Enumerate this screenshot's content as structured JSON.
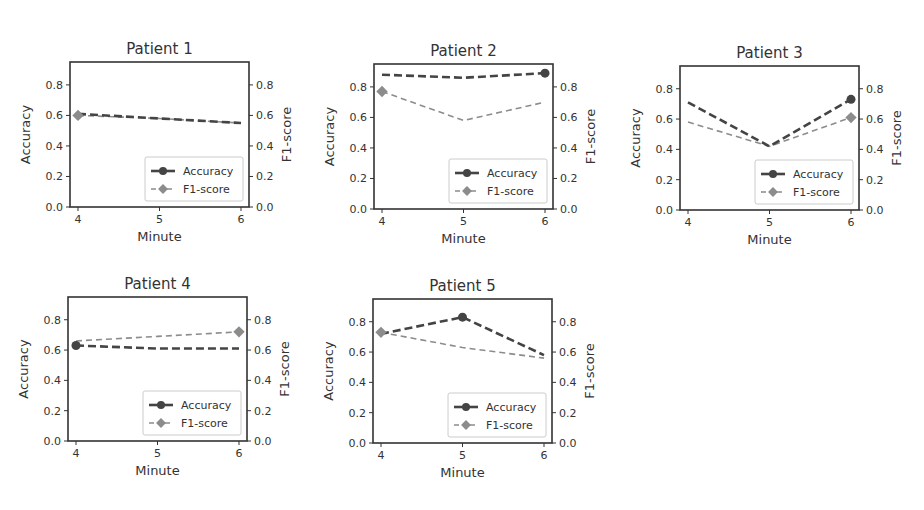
{
  "chart_data": [
    {
      "type": "line",
      "title": "Patient 1",
      "xlabel": "Minute",
      "ylabel": "Accuracy",
      "ylabel_right": "F1-score",
      "x": [
        4,
        5,
        6
      ],
      "xticks": [
        "4",
        "5",
        "6"
      ],
      "yticks": [
        "0.0",
        "0.2",
        "0.4",
        "0.6",
        "0.8"
      ],
      "ylim": [
        0,
        0.95
      ],
      "legend": [
        "Accuracy",
        "F1-score"
      ],
      "legend_position": "lower right",
      "series": [
        {
          "name": "Accuracy",
          "values": [
            0.61,
            0.58,
            0.55
          ]
        },
        {
          "name": "F1-score",
          "values": [
            0.6,
            0.58,
            0.55
          ]
        }
      ]
    },
    {
      "type": "line",
      "title": "Patient 2",
      "xlabel": "Minute",
      "ylabel": "Accuracy",
      "ylabel_right": "F1-score",
      "x": [
        4,
        5,
        6
      ],
      "xticks": [
        "4",
        "5",
        "6"
      ],
      "yticks": [
        "0.0",
        "0.2",
        "0.4",
        "0.6",
        "0.8"
      ],
      "ylim": [
        0,
        0.95
      ],
      "legend": [
        "Accuracy",
        "F1-score"
      ],
      "legend_position": "lower right",
      "series": [
        {
          "name": "Accuracy",
          "values": [
            0.88,
            0.86,
            0.89
          ]
        },
        {
          "name": "F1-score",
          "values": [
            0.77,
            0.58,
            0.7
          ]
        }
      ]
    },
    {
      "type": "line",
      "title": "Patient 3",
      "xlabel": "Minute",
      "ylabel": "Accuracy",
      "ylabel_right": "F1-score",
      "x": [
        4,
        5,
        6
      ],
      "xticks": [
        "4",
        "5",
        "6"
      ],
      "yticks": [
        "0.0",
        "0.2",
        "0.4",
        "0.6",
        "0.8"
      ],
      "ylim": [
        0,
        0.95
      ],
      "legend": [
        "Accuracy",
        "F1-score"
      ],
      "legend_position": "lower right",
      "series": [
        {
          "name": "Accuracy",
          "values": [
            0.71,
            0.42,
            0.73
          ]
        },
        {
          "name": "F1-score",
          "values": [
            0.58,
            0.42,
            0.61
          ]
        }
      ]
    },
    {
      "type": "line",
      "title": "Patient 4",
      "xlabel": "Minute",
      "ylabel": "Accuracy",
      "ylabel_right": "F1-score",
      "x": [
        4,
        5,
        6
      ],
      "xticks": [
        "4",
        "5",
        "6"
      ],
      "yticks": [
        "0.0",
        "0.2",
        "0.4",
        "0.6",
        "0.8"
      ],
      "ylim": [
        0,
        0.95
      ],
      "legend": [
        "Accuracy",
        "F1-score"
      ],
      "legend_position": "lower right",
      "series": [
        {
          "name": "Accuracy",
          "values": [
            0.63,
            0.61,
            0.61
          ]
        },
        {
          "name": "F1-score",
          "values": [
            0.66,
            0.69,
            0.72
          ]
        }
      ]
    },
    {
      "type": "line",
      "title": "Patient 5",
      "xlabel": "Minute",
      "ylabel": "Accuracy",
      "ylabel_right": "F1-score",
      "x": [
        4,
        5,
        6
      ],
      "xticks": [
        "4",
        "5",
        "6"
      ],
      "yticks": [
        "0.0",
        "0.2",
        "0.4",
        "0.6",
        "0.8"
      ],
      "ylim": [
        0,
        0.95
      ],
      "legend": [
        "Accuracy",
        "F1-score"
      ],
      "legend_position": "lower right",
      "series": [
        {
          "name": "Accuracy",
          "values": [
            0.72,
            0.83,
            0.58
          ]
        },
        {
          "name": "F1-score",
          "values": [
            0.73,
            0.63,
            0.56
          ]
        }
      ]
    }
  ],
  "layout": [
    {
      "left": 70,
      "top": 62,
      "width": 179,
      "height": 145
    },
    {
      "left": 374,
      "top": 64,
      "width": 179,
      "height": 145
    },
    {
      "left": 680,
      "top": 66,
      "width": 179,
      "height": 144
    },
    {
      "left": 68,
      "top": 297,
      "width": 179,
      "height": 144
    },
    {
      "left": 373,
      "top": 299,
      "width": 179,
      "height": 144
    }
  ],
  "colors": {
    "accuracy": "#444444",
    "f1": "#8c8c8c",
    "axis": "#333333",
    "text": "#333333",
    "legend_border": "#cccccc"
  }
}
